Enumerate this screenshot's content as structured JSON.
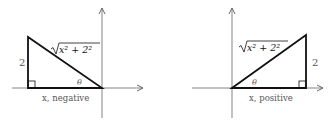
{
  "diagrams": [
    {
      "name": "left",
      "hypotenuse_label": "x² + 2²",
      "vertical_label": "2",
      "angle_label": "θ",
      "horizontal_label": "x, negative"
    },
    {
      "name": "right",
      "hypotenuse_label": "x² + 2²",
      "vertical_label": "2",
      "angle_label": "θ",
      "horizontal_label": "x, positive"
    }
  ],
  "colors": {
    "axis": "#666666",
    "triangle": "#111111",
    "label": "#555555"
  }
}
